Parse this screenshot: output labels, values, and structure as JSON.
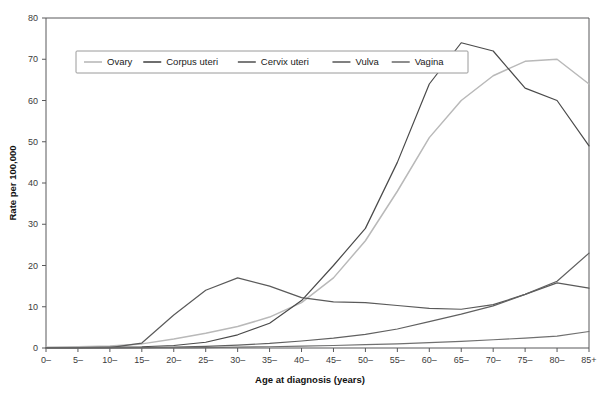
{
  "chart_data": {
    "type": "line",
    "title": "",
    "xlabel": "Age at diagnosis (years)",
    "ylabel": "Rate per 100,000",
    "grid": false,
    "legend_position": "top-left-inside",
    "categories": [
      "0–",
      "5–",
      "10–",
      "15–",
      "20–",
      "25–",
      "30–",
      "35–",
      "40–",
      "45–",
      "50–",
      "55–",
      "60–",
      "65–",
      "70–",
      "75–",
      "80–",
      "85+"
    ],
    "xlim": [
      0,
      17
    ],
    "ylim": [
      0,
      80
    ],
    "yticks": [
      0,
      10,
      20,
      30,
      40,
      50,
      60,
      70,
      80
    ],
    "series": [
      {
        "name": "Ovary",
        "color": "#b9b9b9",
        "values": [
          0.2,
          0.3,
          0.5,
          1.0,
          2.2,
          3.6,
          5.2,
          7.5,
          11.0,
          17.0,
          26.0,
          38.0,
          51.0,
          60.0,
          66.0,
          69.5,
          70.0,
          64.0
        ]
      },
      {
        "name": "Corpus uteri",
        "color": "#4a4a4a",
        "values": [
          0.1,
          0.1,
          0.2,
          0.3,
          0.6,
          1.4,
          3.2,
          6.0,
          11.5,
          20.0,
          29.0,
          45.0,
          64.0,
          74.0,
          72.0,
          63.0,
          60.0,
          49.0
        ]
      },
      {
        "name": "Cervix uteri",
        "color": "#5a5a5a",
        "values": [
          0.0,
          0.0,
          0.1,
          1.2,
          8.0,
          14.0,
          17.0,
          15.0,
          12.2,
          11.2,
          11.0,
          10.3,
          9.6,
          9.4,
          10.5,
          13.0,
          15.8,
          14.5
        ]
      },
      {
        "name": "Vulva",
        "color": "#606060",
        "values": [
          0.0,
          0.0,
          0.0,
          0.1,
          0.2,
          0.4,
          0.7,
          1.1,
          1.7,
          2.4,
          3.3,
          4.6,
          6.4,
          8.2,
          10.2,
          13.0,
          16.2,
          23.0
        ]
      },
      {
        "name": "Vagina",
        "color": "#707070",
        "values": [
          0.0,
          0.0,
          0.0,
          0.0,
          0.05,
          0.1,
          0.2,
          0.3,
          0.45,
          0.6,
          0.8,
          1.0,
          1.3,
          1.6,
          2.0,
          2.4,
          2.9,
          4.0
        ]
      }
    ]
  },
  "axes": {
    "x_title": "Age at diagnosis (years)",
    "y_title": "Rate per 100,000",
    "x_tick_labels": [
      "0–",
      "5–",
      "10–",
      "15–",
      "20–",
      "25–",
      "30–",
      "35–",
      "40–",
      "45–",
      "50–",
      "55–",
      "60–",
      "65–",
      "70–",
      "75–",
      "80–",
      "85+"
    ],
    "y_tick_labels": [
      "0",
      "10",
      "20",
      "30",
      "40",
      "50",
      "60",
      "70",
      "80"
    ]
  },
  "legend": {
    "items": [
      {
        "label": "Ovary"
      },
      {
        "label": "Corpus uteri"
      },
      {
        "label": "Cervix uteri"
      },
      {
        "label": "Vulva"
      },
      {
        "label": "Vagina"
      }
    ]
  }
}
